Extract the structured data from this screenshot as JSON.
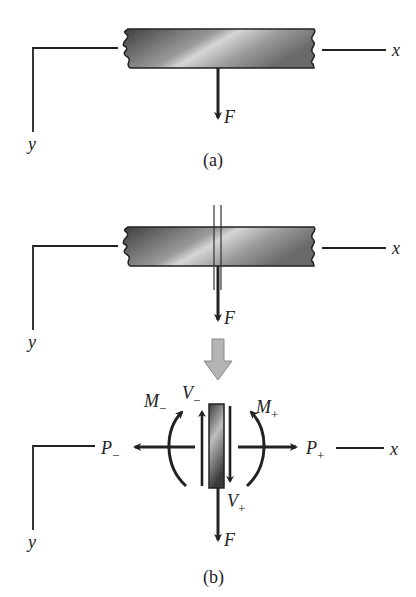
{
  "figure": {
    "panel_a": {
      "caption": "(a)",
      "axis_x": "x",
      "axis_y": "y",
      "force": "F"
    },
    "panel_b": {
      "caption": "(b)",
      "axis_x": "x",
      "axis_y": "y",
      "force_top": "F",
      "force_bottom": "F",
      "P_minus": "P",
      "P_minus_sub": "−",
      "P_plus": "P",
      "P_plus_sub": "+",
      "V_minus": "V",
      "V_minus_sub": "−",
      "V_plus": "V",
      "V_plus_sub": "+",
      "M_minus": "M",
      "M_minus_sub": "−",
      "M_plus": "M",
      "M_plus_sub": "+"
    }
  },
  "colors": {
    "ink": "#222222",
    "bar_dark": "#4a4a4a",
    "bar_light": "#d8d8d8",
    "block_arrow": "#b4b4b4"
  }
}
